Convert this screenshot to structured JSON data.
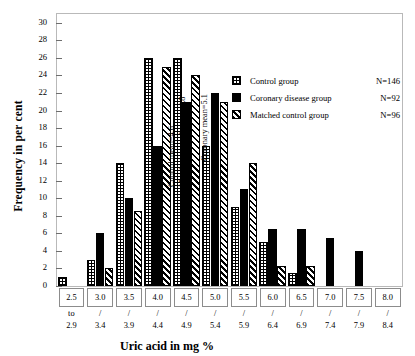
{
  "chart_data": {
    "type": "bar",
    "title": "",
    "xlabel": "Uric acid in mg  %",
    "ylabel": "Frequency in per cent",
    "ylim": [
      0,
      31
    ],
    "yticks": [
      0,
      2,
      4,
      6,
      8,
      10,
      12,
      14,
      16,
      18,
      20,
      22,
      24,
      26,
      28,
      30
    ],
    "grid": false,
    "legend_position": "top-right",
    "categories": [
      "2.5 to 2.9",
      "3.0 / 3.4",
      "3.5 / 3.9",
      "4.0 / 4.4",
      "4.5 / 4.9",
      "5.0 / 5.4",
      "5.5 / 5.9",
      "6.0 / 6.4",
      "6.5 / 6.9",
      "7.0 / 7.4",
      "7.5 / 7.9",
      "8.0 / 8.4"
    ],
    "category_top": [
      "2.5",
      "3.0",
      "3.5",
      "4.0",
      "4.5",
      "5.0",
      "5.5",
      "6.0",
      "6.5",
      "7.0",
      "7.5",
      "8.0"
    ],
    "category_bottom": [
      "to\n2.9",
      "/\n3.4",
      "/\n3.9",
      "/\n4.4",
      "/\n4.9",
      "/\n5.4",
      "/\n5.9",
      "/\n6.4",
      "/\n6.9",
      "/\n7.4",
      "/\n7.9",
      "/\n8.4"
    ],
    "series": [
      {
        "name": "Control group",
        "n_label": "N=146",
        "fill": "cross-hatch",
        "values": [
          1,
          3,
          14,
          26,
          26,
          16,
          9,
          5,
          1.5,
          0,
          0,
          0
        ]
      },
      {
        "name": "Coronary disease group",
        "n_label": "N=92",
        "fill": "solid-black",
        "values": [
          0,
          6,
          10,
          16,
          21,
          22,
          11,
          6.5,
          6.5,
          5.5,
          4,
          0
        ]
      },
      {
        "name": "Matched control group",
        "n_label": "N=96",
        "fill": "diagonal-hatch",
        "values": [
          0,
          2,
          8.5,
          25,
          24,
          21,
          14,
          2.3,
          2.3,
          0,
          0,
          0
        ]
      }
    ],
    "annotations": [
      {
        "text": "Control mean=4.6",
        "category": "4.5 / 4.9"
      },
      {
        "text": "Matched control mean=4.8",
        "category": "4.5 / 4.9"
      },
      {
        "text": "Coronary mean=5.1",
        "category": "5.0 / 5.4"
      }
    ]
  },
  "colors": {
    "ink": "#000000",
    "frame": "#b9b9b9",
    "axis": "#8c8c8c",
    "background": "#ffffff"
  }
}
